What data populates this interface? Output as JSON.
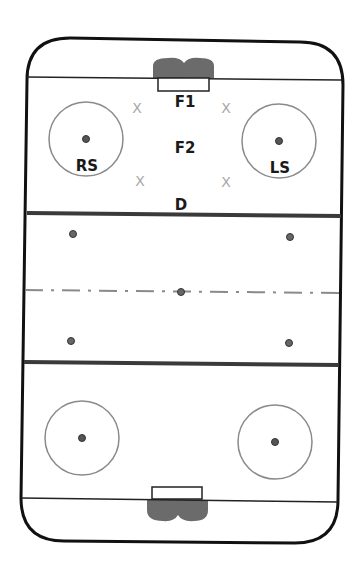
{
  "diagram": {
    "type": "hockey-rink-faceoff-alignment",
    "colors": {
      "boards": "#111111",
      "goal_line": "#222222",
      "blue_line": "#3a3a3a",
      "center_line": "#8a8a8a",
      "circle": "#8a8a8a",
      "dot": "#555555",
      "crease": "#6b6b6b",
      "x_marker": "#a8a8a8",
      "label": "#1a1a1a"
    },
    "labels": {
      "f1": "F1",
      "f2": "F2",
      "rs": "RS",
      "ls": "LS",
      "d": "D"
    },
    "x_markers": [
      "X",
      "X",
      "X",
      "X"
    ],
    "players": [
      {
        "id": "F1",
        "role": "Center forward",
        "x": 185,
        "y": 101
      },
      {
        "id": "F2",
        "role": "Forward",
        "x": 185,
        "y": 147
      },
      {
        "id": "RS",
        "role": "Right side",
        "x": 86,
        "y": 165
      },
      {
        "id": "LS",
        "role": "Left side",
        "x": 279,
        "y": 167
      },
      {
        "id": "D",
        "role": "Defense",
        "x": 181,
        "y": 204
      }
    ]
  }
}
